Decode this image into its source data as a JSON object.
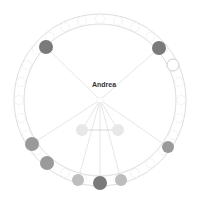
{
  "diagram": {
    "center_label": "Andrea",
    "center": {
      "x": 100,
      "y": 100
    },
    "ring": {
      "outer_r": 86,
      "inner_r": 76,
      "stroke": "#dddddd"
    },
    "colors": {
      "dark": "#7a7a7a",
      "medium": "#9a9a9a",
      "light": "#bdbdbd",
      "pale": "#e8e8e8",
      "hollow_stroke": "#cfcfcf",
      "edge": "#e0e0e0"
    },
    "nodes": [
      {
        "id": "n1",
        "x": 46,
        "y": 47,
        "r": 7,
        "tone": "dark",
        "linked": true
      },
      {
        "id": "n2",
        "x": 159,
        "y": 48,
        "r": 7,
        "tone": "dark",
        "linked": true
      },
      {
        "id": "n3",
        "x": 173,
        "y": 65,
        "r": 6,
        "tone": "hollow",
        "linked": false
      },
      {
        "id": "n4",
        "x": 32,
        "y": 144,
        "r": 7,
        "tone": "medium",
        "linked": true
      },
      {
        "id": "n5",
        "x": 47,
        "y": 163,
        "r": 7,
        "tone": "medium",
        "linked": false
      },
      {
        "id": "n6",
        "x": 78,
        "y": 180,
        "r": 6,
        "tone": "light",
        "linked": true
      },
      {
        "id": "n7",
        "x": 100,
        "y": 183,
        "r": 7,
        "tone": "dark",
        "linked": true
      },
      {
        "id": "n8",
        "x": 121,
        "y": 180,
        "r": 6,
        "tone": "light",
        "linked": true
      },
      {
        "id": "n9",
        "x": 168,
        "y": 147,
        "r": 6,
        "tone": "medium",
        "linked": true
      },
      {
        "id": "n10",
        "x": 82,
        "y": 130,
        "r": 6,
        "tone": "pale",
        "linked": true
      },
      {
        "id": "n11",
        "x": 118,
        "y": 130,
        "r": 6,
        "tone": "pale",
        "linked": true
      }
    ],
    "extra_edges": [
      {
        "from": "n10",
        "to": "n11"
      }
    ],
    "ring_slots": 28
  }
}
